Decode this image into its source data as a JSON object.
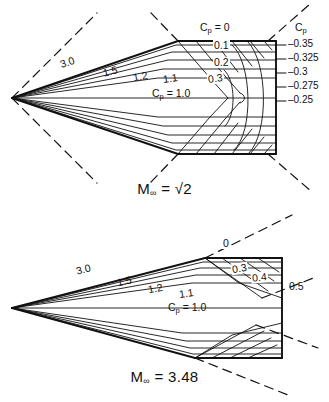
{
  "figure": {
    "type": "diagram"
  },
  "panels": [
    {
      "id": "panel-top",
      "mach_caption_prefix": "M",
      "mach_caption_sub": "∞",
      "mach_caption_eq": "=",
      "mach_caption_value": "√2",
      "mach_value_numeric": 1.414,
      "surface_labels": [
        {
          "text": "3.0",
          "x": 60,
          "y": 57
        },
        {
          "text": "1.5",
          "x": 103,
          "y": 66
        },
        {
          "text": "1.2",
          "x": 133,
          "y": 71
        },
        {
          "text": "1.1",
          "x": 163,
          "y": 73
        }
      ],
      "stagnation_label": {
        "text_prefix": "C",
        "text_sub": "p",
        "text_rest": " = 1.0",
        "x": 152,
        "y": 93
      },
      "top_contour_labels": [
        {
          "text_prefix": "C",
          "text_sub": "p",
          "text_rest": " = 0",
          "x": 200,
          "y": 24
        },
        {
          "text": "0.1",
          "x": 213,
          "y": 45
        },
        {
          "text": "0.2",
          "x": 213,
          "y": 62
        },
        {
          "text": "0.3",
          "x": 209,
          "y": 78
        }
      ],
      "right_axis_title_prefix": "C",
      "right_axis_title_sub": "p",
      "right_axis_title_x": 297,
      "right_axis_title_y": 27,
      "right_axis_values": [
        {
          "text": "–0.35",
          "x": 289,
          "y": 44
        },
        {
          "text": "–0.325",
          "x": 289,
          "y": 58
        },
        {
          "text": "–0.3",
          "x": 289,
          "y": 72
        },
        {
          "text": "–0.275",
          "x": 289,
          "y": 86
        },
        {
          "text": "–0.25",
          "x": 289,
          "y": 100
        }
      ]
    },
    {
      "id": "panel-bottom",
      "mach_caption_prefix": "M",
      "mach_caption_sub": "∞",
      "mach_caption_eq": "=",
      "mach_caption_value": "3.48",
      "mach_value_numeric": 3.48,
      "surface_labels": [
        {
          "text": "3.0",
          "x": 76,
          "y": 63
        },
        {
          "text": "1.5",
          "x": 117,
          "y": 75
        },
        {
          "text": "1.2",
          "x": 148,
          "y": 82
        },
        {
          "text": "1.1",
          "x": 179,
          "y": 87
        }
      ],
      "stagnation_label": {
        "text_prefix": "C",
        "text_sub": "p",
        "text_rest": " = 1.0",
        "x": 168,
        "y": 103
      },
      "top_contour_labels": [
        {
          "text": "0",
          "x": 222,
          "y": 35
        },
        {
          "text": "0.3",
          "x": 233,
          "y": 62
        },
        {
          "text": "0.4",
          "x": 252,
          "y": 72
        },
        {
          "text": "0.5",
          "x": 290,
          "y": 82
        }
      ]
    }
  ],
  "colors": {
    "line": "#111111",
    "background": "#ffffff"
  }
}
